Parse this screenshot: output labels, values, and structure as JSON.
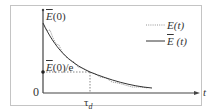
{
  "diagram": {
    "title": "",
    "axes": {
      "origin_label": "0",
      "x_label": "t",
      "tau_label": "τ",
      "tau_subscript": "d"
    },
    "y_labels": {
      "top_prefix": "E",
      "top_suffix": "(0)",
      "mid_prefix": "E",
      "mid_suffix": "(0)/e"
    },
    "legend": [
      {
        "prefix": "",
        "name": "E",
        "arg": "(t)",
        "style": "dotted"
      },
      {
        "prefix": "",
        "name": "E",
        "arg": " (t)",
        "style": "solid",
        "overline": true
      }
    ],
    "colors": {
      "frame": "#bbbbbb",
      "axis": "#444444",
      "curve": "#333333",
      "dotted": "#777777"
    }
  }
}
